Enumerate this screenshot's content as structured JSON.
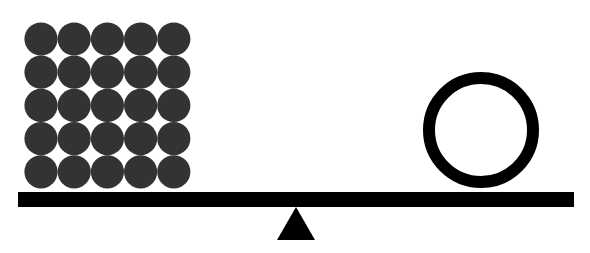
{
  "diagram": {
    "state": "level",
    "left_pan": {
      "object": "ball-grid",
      "rows": 5,
      "columns": 5,
      "count": 25,
      "color": "#333333"
    },
    "right_pan": {
      "object": "ring",
      "count": 1,
      "color": "#000000"
    },
    "beam_color": "#000000",
    "fulcrum": {
      "shape": "triangle",
      "color": "#000000"
    }
  }
}
